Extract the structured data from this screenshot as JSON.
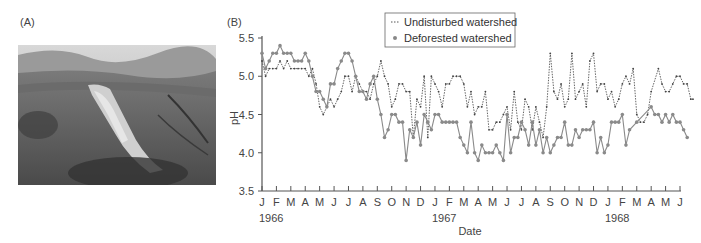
{
  "panels": {
    "a_label": "(A)",
    "b_label": "(B)"
  },
  "photo": {
    "alt": "Aerial photograph of a hillside with a deforested strip"
  },
  "chart_data": {
    "type": "line",
    "title": "",
    "xlabel": "Date",
    "ylabel": "pH",
    "ylim": [
      3.5,
      5.5
    ],
    "yticks": [
      3.5,
      4.0,
      4.5,
      5.0,
      5.5
    ],
    "ytick_labels": [
      "3.5",
      "4.0",
      "4.5",
      "5.0",
      "5.5"
    ],
    "xtick_labels": [
      "J",
      "F",
      "M",
      "A",
      "M",
      "J",
      "J",
      "A",
      "S",
      "O",
      "N",
      "D",
      "J",
      "F",
      "M",
      "A",
      "M",
      "J",
      "J",
      "A",
      "S",
      "O",
      "N",
      "D",
      "J",
      "F",
      "M",
      "A",
      "M",
      "J"
    ],
    "year_labels": [
      {
        "label": "1966",
        "month_index": 0.5
      },
      {
        "label": "1967",
        "month_index": 12.5
      },
      {
        "label": "1968",
        "month_index": 24.5
      }
    ],
    "grid": false,
    "legend_position": "top-center",
    "series": [
      {
        "name": "Undisturbed watershed",
        "style": "dotted-line-small-markers",
        "color": "#666666",
        "points": [
          [
            0.0,
            5.2
          ],
          [
            0.25,
            5.0
          ],
          [
            0.5,
            5.1
          ],
          [
            0.75,
            5.1
          ],
          [
            1.0,
            5.1
          ],
          [
            1.25,
            5.2
          ],
          [
            1.5,
            5.1
          ],
          [
            1.75,
            5.2
          ],
          [
            2.0,
            5.1
          ],
          [
            2.25,
            5.1
          ],
          [
            2.5,
            5.1
          ],
          [
            2.75,
            5.1
          ],
          [
            3.0,
            5.1
          ],
          [
            3.25,
            5.0
          ],
          [
            3.5,
            5.1
          ],
          [
            3.75,
            4.9
          ],
          [
            4.0,
            4.6
          ],
          [
            4.25,
            4.5
          ],
          [
            4.5,
            4.6
          ],
          [
            4.75,
            4.7
          ],
          [
            5.0,
            4.6
          ],
          [
            5.25,
            4.7
          ],
          [
            5.5,
            4.8
          ],
          [
            5.75,
            5.0
          ],
          [
            6.0,
            5.0
          ],
          [
            6.25,
            4.8
          ],
          [
            6.5,
            5.0
          ],
          [
            6.75,
            4.9
          ],
          [
            7.0,
            4.8
          ],
          [
            7.25,
            4.8
          ],
          [
            7.5,
            4.7
          ],
          [
            7.75,
            4.9
          ],
          [
            8.0,
            5.0
          ],
          [
            8.25,
            5.2
          ],
          [
            8.5,
            5.0
          ],
          [
            8.75,
            4.9
          ],
          [
            9.0,
            4.6
          ],
          [
            9.25,
            4.7
          ],
          [
            9.5,
            4.9
          ],
          [
            9.75,
            4.9
          ],
          [
            10.0,
            4.8
          ],
          [
            10.25,
            4.8
          ],
          [
            10.5,
            4.2
          ],
          [
            10.75,
            4.7
          ],
          [
            11.0,
            4.6
          ],
          [
            11.25,
            5.0
          ],
          [
            11.5,
            4.2
          ],
          [
            11.75,
            5.0
          ],
          [
            12.0,
            4.9
          ],
          [
            12.25,
            4.8
          ],
          [
            12.5,
            4.6
          ],
          [
            12.75,
            4.9
          ],
          [
            13.0,
            4.9
          ],
          [
            13.25,
            5.0
          ],
          [
            13.5,
            5.0
          ],
          [
            13.75,
            5.0
          ],
          [
            14.0,
            4.9
          ],
          [
            14.25,
            4.6
          ],
          [
            14.5,
            4.8
          ],
          [
            14.75,
            4.5
          ],
          [
            15.0,
            4.6
          ],
          [
            15.25,
            4.6
          ],
          [
            15.5,
            4.8
          ],
          [
            15.75,
            4.3
          ],
          [
            16.0,
            4.3
          ],
          [
            16.25,
            4.4
          ],
          [
            16.5,
            4.4
          ],
          [
            16.75,
            4.5
          ],
          [
            17.0,
            4.6
          ],
          [
            17.25,
            4.3
          ],
          [
            17.5,
            4.8
          ],
          [
            17.75,
            4.4
          ],
          [
            18.0,
            4.3
          ],
          [
            18.25,
            4.7
          ],
          [
            18.5,
            4.6
          ],
          [
            18.75,
            4.3
          ],
          [
            19.0,
            4.6
          ],
          [
            19.25,
            4.4
          ],
          [
            19.5,
            4.2
          ],
          [
            19.75,
            4.6
          ],
          [
            20.0,
            5.3
          ],
          [
            20.25,
            4.8
          ],
          [
            20.5,
            4.7
          ],
          [
            20.75,
            4.9
          ],
          [
            21.0,
            4.6
          ],
          [
            21.25,
            4.7
          ],
          [
            21.5,
            5.3
          ],
          [
            21.75,
            4.7
          ],
          [
            22.0,
            4.8
          ],
          [
            22.25,
            4.9
          ],
          [
            22.5,
            4.6
          ],
          [
            22.75,
            5.2
          ],
          [
            23.0,
            5.3
          ],
          [
            23.25,
            4.8
          ],
          [
            23.5,
            4.9
          ],
          [
            23.75,
            4.9
          ],
          [
            24.0,
            4.7
          ],
          [
            24.25,
            4.8
          ],
          [
            24.5,
            4.6
          ],
          [
            24.75,
            4.7
          ],
          [
            25.0,
            4.9
          ],
          [
            25.25,
            5.0
          ],
          [
            25.5,
            4.9
          ],
          [
            25.75,
            5.1
          ],
          [
            26.0,
            4.5
          ],
          [
            26.25,
            4.4
          ],
          [
            26.5,
            4.4
          ],
          [
            26.75,
            4.5
          ],
          [
            27.0,
            4.8
          ],
          [
            27.5,
            5.1
          ],
          [
            27.75,
            4.9
          ],
          [
            28.0,
            4.8
          ],
          [
            28.25,
            4.8
          ],
          [
            28.5,
            4.9
          ],
          [
            28.75,
            5.0
          ],
          [
            29.0,
            5.0
          ],
          [
            29.25,
            4.9
          ],
          [
            29.5,
            4.9
          ],
          [
            29.75,
            4.7
          ],
          [
            29.9,
            4.7
          ]
        ]
      },
      {
        "name": "Deforested watershed",
        "style": "solid-line-round-markers",
        "color": "#888888",
        "points": [
          [
            0.0,
            5.3
          ],
          [
            0.25,
            5.1
          ],
          [
            0.5,
            5.2
          ],
          [
            0.75,
            5.3
          ],
          [
            1.0,
            5.3
          ],
          [
            1.25,
            5.4
          ],
          [
            1.5,
            5.3
          ],
          [
            1.75,
            5.3
          ],
          [
            2.0,
            5.3
          ],
          [
            2.25,
            5.2
          ],
          [
            2.5,
            5.2
          ],
          [
            2.75,
            5.2
          ],
          [
            3.0,
            5.3
          ],
          [
            3.25,
            5.2
          ],
          [
            3.5,
            5.0
          ],
          [
            3.75,
            4.8
          ],
          [
            4.0,
            4.8
          ],
          [
            4.25,
            4.7
          ],
          [
            4.5,
            4.6
          ],
          [
            4.75,
            4.9
          ],
          [
            5.0,
            4.9
          ],
          [
            5.25,
            5.1
          ],
          [
            5.5,
            5.2
          ],
          [
            5.75,
            5.3
          ],
          [
            6.0,
            5.3
          ],
          [
            6.25,
            5.2
          ],
          [
            6.5,
            5.0
          ],
          [
            6.75,
            4.8
          ],
          [
            7.0,
            4.8
          ],
          [
            7.25,
            4.7
          ],
          [
            7.5,
            4.9
          ],
          [
            7.75,
            5.0
          ],
          [
            8.0,
            4.7
          ],
          [
            8.25,
            4.5
          ],
          [
            8.5,
            4.2
          ],
          [
            8.75,
            4.3
          ],
          [
            9.0,
            4.5
          ],
          [
            9.25,
            4.5
          ],
          [
            9.5,
            4.4
          ],
          [
            9.75,
            4.4
          ],
          [
            10.0,
            3.9
          ],
          [
            10.25,
            4.3
          ],
          [
            10.5,
            4.2
          ],
          [
            10.75,
            4.4
          ],
          [
            11.0,
            4.1
          ],
          [
            11.25,
            4.5
          ],
          [
            11.5,
            4.4
          ],
          [
            11.75,
            4.3
          ],
          [
            12.0,
            4.5
          ],
          [
            12.25,
            4.5
          ],
          [
            12.5,
            4.4
          ],
          [
            12.75,
            4.4
          ],
          [
            13.0,
            4.4
          ],
          [
            13.25,
            4.4
          ],
          [
            13.5,
            4.4
          ],
          [
            13.75,
            4.2
          ],
          [
            14.0,
            4.1
          ],
          [
            14.25,
            4.0
          ],
          [
            14.5,
            4.4
          ],
          [
            14.75,
            4.0
          ],
          [
            15.0,
            3.9
          ],
          [
            15.25,
            4.1
          ],
          [
            15.5,
            4.0
          ],
          [
            15.75,
            4.0
          ],
          [
            16.0,
            4.0
          ],
          [
            16.25,
            4.1
          ],
          [
            16.5,
            4.0
          ],
          [
            16.75,
            3.9
          ],
          [
            17.0,
            4.5
          ],
          [
            17.25,
            4.0
          ],
          [
            17.5,
            4.2
          ],
          [
            17.75,
            4.2
          ],
          [
            18.0,
            4.4
          ],
          [
            18.25,
            4.3
          ],
          [
            18.5,
            4.1
          ],
          [
            18.75,
            4.4
          ],
          [
            19.0,
            4.1
          ],
          [
            19.25,
            4.3
          ],
          [
            19.5,
            4.0
          ],
          [
            19.75,
            4.2
          ],
          [
            20.0,
            4.0
          ],
          [
            20.25,
            4.1
          ],
          [
            20.5,
            4.2
          ],
          [
            20.75,
            4.2
          ],
          [
            21.0,
            4.4
          ],
          [
            21.25,
            4.1
          ],
          [
            21.5,
            4.1
          ],
          [
            21.75,
            4.3
          ],
          [
            22.0,
            4.2
          ],
          [
            22.25,
            4.3
          ],
          [
            22.5,
            4.3
          ],
          [
            22.75,
            4.3
          ],
          [
            23.0,
            4.4
          ],
          [
            23.25,
            4.0
          ],
          [
            23.5,
            4.2
          ],
          [
            23.75,
            4.0
          ],
          [
            24.0,
            4.1
          ],
          [
            24.25,
            4.4
          ],
          [
            24.5,
            4.4
          ],
          [
            24.75,
            4.4
          ],
          [
            25.0,
            4.5
          ],
          [
            25.25,
            4.1
          ],
          [
            25.5,
            4.3
          ],
          [
            26.0,
            4.4
          ],
          [
            27.0,
            4.6
          ],
          [
            27.25,
            4.5
          ],
          [
            27.5,
            4.5
          ],
          [
            27.75,
            4.4
          ],
          [
            28.0,
            4.5
          ],
          [
            28.25,
            4.4
          ],
          [
            28.5,
            4.5
          ],
          [
            28.75,
            4.4
          ],
          [
            29.0,
            4.4
          ],
          [
            29.25,
            4.3
          ],
          [
            29.5,
            4.2
          ]
        ]
      }
    ]
  }
}
